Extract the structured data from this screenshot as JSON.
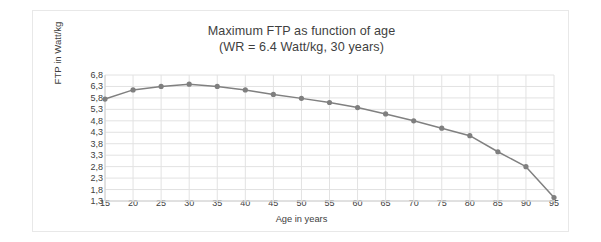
{
  "chart_data": {
    "type": "line",
    "title": "Maximum FTP as function of age",
    "subtitle": "(WR = 6.4 Watt/kg, 30 years)",
    "xlabel": "Age in years",
    "ylabel": "FTP in Watt/kg",
    "x": [
      15,
      20,
      25,
      30,
      35,
      40,
      45,
      50,
      55,
      60,
      65,
      70,
      75,
      80,
      85,
      90,
      95
    ],
    "values": [
      5.75,
      6.15,
      6.3,
      6.4,
      6.3,
      6.15,
      5.95,
      5.78,
      5.6,
      5.38,
      5.1,
      4.8,
      4.48,
      4.15,
      3.45,
      2.8,
      1.45
    ],
    "series": [
      {
        "name": "Maximum FTP",
        "values": [
          5.75,
          6.15,
          6.3,
          6.4,
          6.3,
          6.15,
          5.95,
          5.78,
          5.6,
          5.38,
          5.1,
          4.8,
          4.48,
          4.15,
          3.45,
          2.8,
          1.45
        ]
      }
    ],
    "xlim": [
      15,
      95
    ],
    "ylim": [
      1.3,
      6.8
    ],
    "ytick_labels": [
      "6,8",
      "6,3",
      "5,8",
      "5,3",
      "4,8",
      "4,3",
      "3,8",
      "3,3",
      "2,8",
      "2,3",
      "1,8",
      "1,3"
    ],
    "ytick_values": [
      6.8,
      6.3,
      5.8,
      5.3,
      4.8,
      4.3,
      3.8,
      3.3,
      2.8,
      2.3,
      1.8,
      1.3
    ],
    "xtick_labels": [
      "15",
      "20",
      "25",
      "30",
      "35",
      "40",
      "45",
      "50",
      "55",
      "60",
      "65",
      "70",
      "75",
      "80",
      "85",
      "90",
      "95"
    ],
    "xtick_values": [
      15,
      20,
      25,
      30,
      35,
      40,
      45,
      50,
      55,
      60,
      65,
      70,
      75,
      80,
      85,
      90,
      95
    ],
    "grid": true,
    "legend": false,
    "legend_position": "none",
    "line_color": "#808080",
    "marker_color": "#7f7f7f",
    "grid_color": "#e2e2e2",
    "axis_color": "#d0d0d0",
    "text_color": "#404040",
    "background": "#ffffff"
  }
}
